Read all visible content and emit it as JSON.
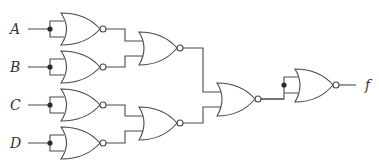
{
  "diagram": {
    "type": "logic-circuit",
    "inputs": [
      {
        "label": "A",
        "y": 29
      },
      {
        "label": "B",
        "y": 67
      },
      {
        "label": "C",
        "y": 105
      },
      {
        "label": "D",
        "y": 143
      }
    ],
    "output": {
      "label": "f",
      "y": 85
    },
    "gates": [
      {
        "id": "g1",
        "type": "NOR",
        "inputs": [
          "A",
          "A"
        ],
        "role": "inverter"
      },
      {
        "id": "g2",
        "type": "NOR",
        "inputs": [
          "B",
          "B"
        ],
        "role": "inverter"
      },
      {
        "id": "g3",
        "type": "NOR",
        "inputs": [
          "C",
          "C"
        ],
        "role": "inverter"
      },
      {
        "id": "g4",
        "type": "NOR",
        "inputs": [
          "D",
          "D"
        ],
        "role": "inverter"
      },
      {
        "id": "g5",
        "type": "NOR",
        "inputs": [
          "g1",
          "g2"
        ]
      },
      {
        "id": "g6",
        "type": "NOR",
        "inputs": [
          "g3",
          "g4"
        ]
      },
      {
        "id": "g7",
        "type": "NOR",
        "inputs": [
          "g5",
          "g6"
        ]
      },
      {
        "id": "g8",
        "type": "NOR",
        "inputs": [
          "g7",
          "g7"
        ],
        "role": "inverter"
      }
    ],
    "colors": {
      "line": "#4a4a4a",
      "junction": "#2a2a2a",
      "background": "#ffffff"
    }
  }
}
